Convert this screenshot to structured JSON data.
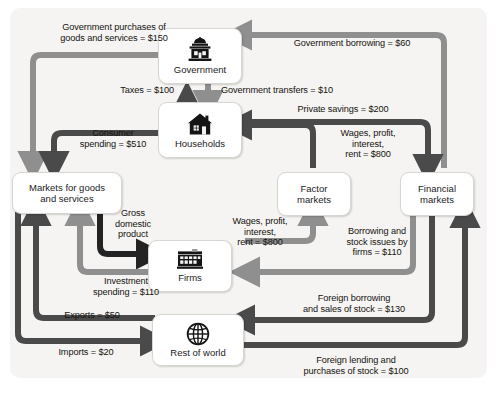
{
  "diagram": {
    "type": "circular-flow",
    "colors": {
      "panel_background": "#f5f4f2",
      "flow_dark": "#4a4a4a",
      "flow_light": "#8f8f8f",
      "flow_black": "#232323",
      "node_fill": "#ffffff",
      "text": "#16130f"
    }
  },
  "nodes": [
    {
      "id": "government",
      "label": "Government",
      "icon": "capitol-building-icon"
    },
    {
      "id": "households",
      "label": "Households",
      "icon": "house-icon"
    },
    {
      "id": "markets",
      "label": "Markets for goods\nand services",
      "icon": "none"
    },
    {
      "id": "factor_markets",
      "label": "Factor\nmarkets",
      "icon": "none"
    },
    {
      "id": "financial_markets",
      "label": "Financial\nmarkets",
      "icon": "none"
    },
    {
      "id": "firms",
      "label": "Firms",
      "icon": "factory-icon"
    },
    {
      "id": "rest_of_world",
      "label": "Rest of world",
      "icon": "globe-icon"
    }
  ],
  "flows": [
    {
      "id": "gov_purchases",
      "label": "Government purchases of\ngoods and services = $150",
      "value": 150,
      "from": "government",
      "to": "markets",
      "shade": "light"
    },
    {
      "id": "gov_borrowing",
      "label": "Government borrowing = $60",
      "value": 60,
      "from": "financial_markets",
      "to": "government",
      "shade": "light"
    },
    {
      "id": "taxes",
      "label": "Taxes = $100",
      "value": 100,
      "from": "households",
      "to": "government",
      "shade": "dark"
    },
    {
      "id": "gov_transfers",
      "label": "Government transfers = $10",
      "value": 10,
      "from": "government",
      "to": "households",
      "shade": "light"
    },
    {
      "id": "private_savings",
      "label": "Private savings = $200",
      "value": 200,
      "from": "households",
      "to": "financial_markets",
      "shade": "dark"
    },
    {
      "id": "consumer_spend",
      "label": "Consumer\nspending = $510",
      "value": 510,
      "from": "households",
      "to": "markets",
      "shade": "dark"
    },
    {
      "id": "wages_to_hh",
      "label": "Wages, profit,\ninterest,\nrent = $800",
      "value": 800,
      "from": "factor_markets",
      "to": "households",
      "shade": "dark"
    },
    {
      "id": "wages_from_firms",
      "label": "Wages, profit,\ninterest,\nrent = $800",
      "value": 800,
      "from": "firms",
      "to": "factor_markets",
      "shade": "light"
    },
    {
      "id": "gdp",
      "label": "Gross\ndomestic\nproduct",
      "value": null,
      "from": "markets",
      "to": "firms",
      "shade": "black"
    },
    {
      "id": "investment",
      "label": "Investment\nspending = $110",
      "value": 110,
      "from": "firms",
      "to": "markets",
      "shade": "light"
    },
    {
      "id": "firm_borrowing",
      "label": "Borrowing and\nstock issues by\nfirms = $110",
      "value": 110,
      "from": "financial_markets",
      "to": "firms",
      "shade": "light"
    },
    {
      "id": "exports",
      "label": "Exports = $50",
      "value": 50,
      "from": "rest_of_world",
      "to": "markets",
      "shade": "dark"
    },
    {
      "id": "imports",
      "label": "Imports = $20",
      "value": 20,
      "from": "markets",
      "to": "rest_of_world",
      "shade": "dark"
    },
    {
      "id": "foreign_borrow",
      "label": "Foreign borrowing\nand sales of stock = $130",
      "value": 130,
      "from": "financial_markets",
      "to": "rest_of_world",
      "shade": "dark"
    },
    {
      "id": "foreign_lending",
      "label": "Foreign lending and\npurchases of stock = $100",
      "value": 100,
      "from": "rest_of_world",
      "to": "financial_markets",
      "shade": "dark"
    }
  ]
}
